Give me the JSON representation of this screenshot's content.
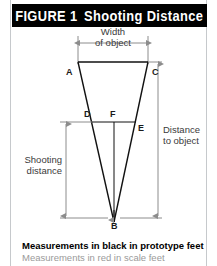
{
  "figure": {
    "title_label": "FIGURE 1",
    "title_name": "Shooting Distance"
  },
  "diagram": {
    "vertices": [
      {
        "id": "A",
        "label": "A"
      },
      {
        "id": "C",
        "label": "C"
      },
      {
        "id": "D",
        "label": "D"
      },
      {
        "id": "F",
        "label": "F"
      },
      {
        "id": "E",
        "label": "E"
      },
      {
        "id": "B",
        "label": "B"
      }
    ],
    "dimensions": [
      {
        "id": "width-of-object",
        "line1": "Width",
        "line2": "of object"
      },
      {
        "id": "distance-to-object",
        "line1": "Distance",
        "line2": "to object"
      },
      {
        "id": "shooting-distance",
        "line1": "Shooting",
        "line2": "distance"
      }
    ]
  },
  "legend": {
    "black_note": "Measurements in black in prototype feet",
    "red_note": "Measurements in red in scale feet"
  },
  "colors": {
    "title_bar_bg": "#000000",
    "title_bar_fg": "#ffffff",
    "frame_rule": "#c6c9cc",
    "triangle_stroke": "#111111",
    "dimension_rule": "#8c8c8c",
    "legend_black": "#000000",
    "legend_red": "#9a9a9a"
  }
}
